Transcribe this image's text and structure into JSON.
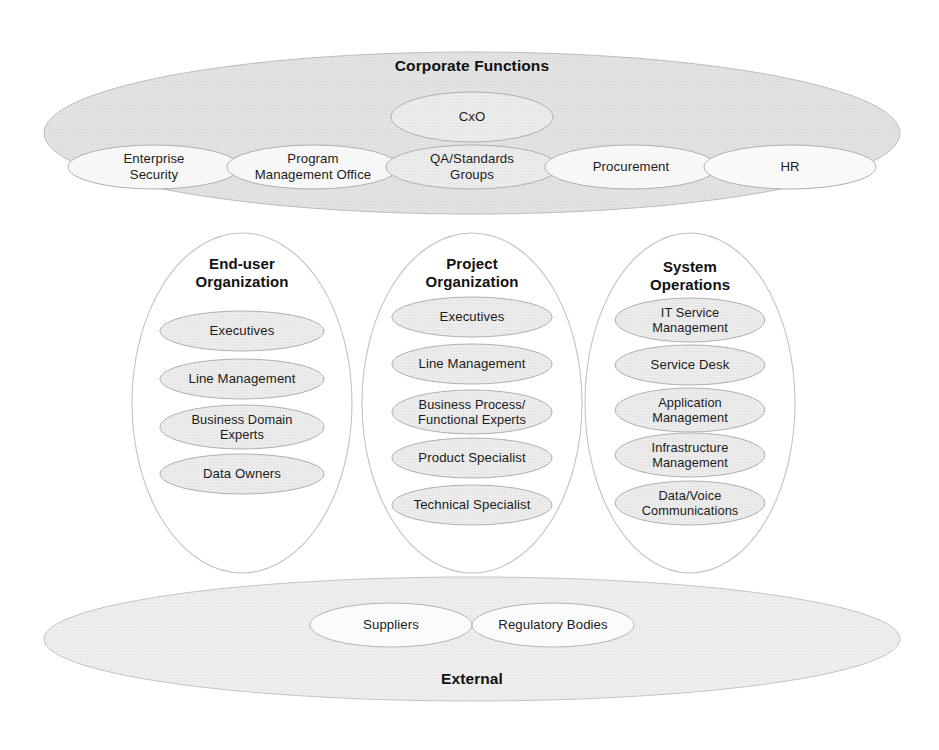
{
  "diagram": {
    "title": "Corporate Functions",
    "bands": {
      "corporate": {
        "title": "Corporate Functions",
        "top_node": "CxO",
        "nodes": [
          "Enterprise\nSecurity",
          "Program\nManagement Office",
          "QA/Standards\nGroups",
          "Procurement",
          "HR"
        ]
      },
      "external": {
        "title": "External",
        "nodes": [
          "Suppliers",
          "Regulatory Bodies"
        ]
      }
    },
    "organizations": [
      {
        "title": "End-user\nOrganization",
        "roles": [
          "Executives",
          "Line Management",
          "Business Domain\nExperts",
          "Data Owners"
        ]
      },
      {
        "title": "Project\nOrganization",
        "roles": [
          "Executives",
          "Line Management",
          "Business Process/\nFunctional Experts",
          "Product Specialist",
          "Technical Specialist"
        ]
      },
      {
        "title": "System\nOperations",
        "roles": [
          "IT Service\nManagement",
          "Service Desk",
          "Application\nManagement",
          "Infrastructure\nManagement",
          "Data/Voice\nCommunications"
        ]
      }
    ],
    "colors": {
      "band_fill": "#e3e3e3",
      "band_stroke": "#b9b9b9",
      "pill_fill": "#ececec",
      "pill_fill_light": "#f6f6f6",
      "pill_stroke": "#b0b0b0",
      "circle_stroke": "#c2c2c2",
      "text": "#1a1a1a",
      "background": "#ffffff"
    }
  }
}
